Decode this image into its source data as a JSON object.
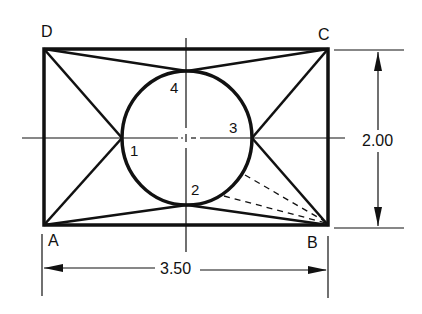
{
  "diagram": {
    "title": "",
    "vertices": {
      "A": "A",
      "B": "B",
      "C": "C",
      "D": "D"
    },
    "tangent_points": {
      "p1": "1",
      "p2": "2",
      "p3": "3",
      "p4": "4"
    },
    "dimensions": {
      "height": "2.00",
      "width": "3.50"
    },
    "colors": {
      "line": "#111111",
      "background": "#ffffff"
    }
  }
}
